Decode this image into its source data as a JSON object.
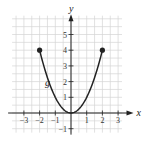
{
  "figure": {
    "type": "function-graph",
    "function_label": "g",
    "x_axis_label": "x",
    "y_axis_label": "y",
    "x_ticks": [
      "-3",
      "-2",
      "-1",
      "1",
      "2",
      "3"
    ],
    "y_ticks": [
      "-1",
      "1",
      "2",
      "3",
      "4",
      "5"
    ],
    "curve": {
      "description": "parabola y = x^2 on domain [-2, 2]",
      "endpoints": [
        [
          -2,
          4
        ],
        [
          2,
          4
        ]
      ],
      "endpoint_style": "closed-dot",
      "vertex": [
        0,
        0
      ]
    },
    "grid": {
      "on": true,
      "minor_step": 0.5,
      "x_range": [
        -3.75,
        3.25
      ],
      "y_range": [
        -1.25,
        6.2
      ]
    },
    "colors": {
      "grid": "#d4d4d4",
      "axis": "#222222",
      "curve": "#222222"
    }
  }
}
